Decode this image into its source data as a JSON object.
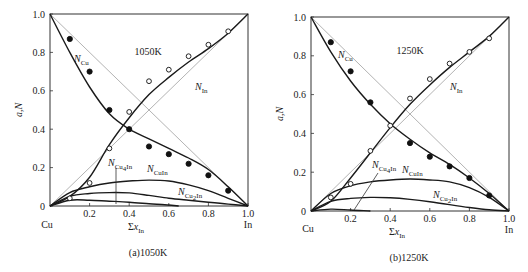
{
  "chart_data": [
    {
      "type": "line",
      "title": "1050K",
      "caption": "(a)1050K",
      "xlabel": "Σx_In",
      "ylabel": "a,N",
      "xlim": [
        0,
        1.0
      ],
      "ylim": [
        0,
        1.0
      ],
      "x_ticks": [
        "0.2",
        "0.4",
        "0.6",
        "0.8",
        "1.0"
      ],
      "y_ticks": [
        "0",
        "0.2",
        "0.4",
        "0.6",
        "0.8",
        "1.0"
      ],
      "x_end_labels": {
        "left": "Cu",
        "right": "In"
      },
      "grid": false,
      "series": [
        {
          "name": "N_Cu (measured a_Cu)",
          "marker": "filled-circle",
          "x": [
            0.1,
            0.2,
            0.3,
            0.4,
            0.5,
            0.6,
            0.7,
            0.8,
            0.9
          ],
          "y": [
            0.87,
            0.7,
            0.5,
            0.4,
            0.31,
            0.27,
            0.22,
            0.16,
            0.08
          ]
        },
        {
          "name": "N_In (measured a_In)",
          "marker": "open-circle",
          "x": [
            0.1,
            0.2,
            0.3,
            0.4,
            0.5,
            0.6,
            0.7,
            0.8,
            0.9
          ],
          "y": [
            0.04,
            0.12,
            0.3,
            0.49,
            0.65,
            0.71,
            0.78,
            0.84,
            0.91
          ]
        },
        {
          "name": "N_Cu curve",
          "x": [
            0,
            0.1,
            0.2,
            0.3,
            0.4,
            0.5,
            0.6,
            0.7,
            0.8,
            0.9,
            1.0
          ],
          "y": [
            1.0,
            0.8,
            0.62,
            0.48,
            0.4,
            0.35,
            0.3,
            0.25,
            0.19,
            0.1,
            0
          ]
        },
        {
          "name": "N_In curve",
          "x": [
            0,
            0.1,
            0.2,
            0.3,
            0.4,
            0.5,
            0.6,
            0.7,
            0.8,
            0.9,
            1.0
          ],
          "y": [
            0,
            0.05,
            0.15,
            0.32,
            0.46,
            0.58,
            0.67,
            0.75,
            0.82,
            0.9,
            1.0
          ]
        },
        {
          "name": "N_CuIn",
          "x": [
            0,
            0.1,
            0.2,
            0.3,
            0.4,
            0.5,
            0.6,
            0.7,
            0.8,
            0.9,
            1.0
          ],
          "y": [
            0,
            0.07,
            0.1,
            0.12,
            0.13,
            0.135,
            0.13,
            0.11,
            0.08,
            0.04,
            0
          ]
        },
        {
          "name": "N_Cu2In",
          "x": [
            0,
            0.1,
            0.2,
            0.3,
            0.4,
            0.5,
            0.6,
            0.7,
            0.8,
            0.9,
            1.0
          ],
          "y": [
            0,
            0.05,
            0.065,
            0.07,
            0.068,
            0.055,
            0.04,
            0.03,
            0.02,
            0.01,
            0
          ]
        },
        {
          "name": "N_Cu4In",
          "x": [
            0,
            0.1,
            0.2,
            0.3,
            0.4,
            0.5,
            0.6,
            0.65
          ],
          "y": [
            0,
            0.03,
            0.03,
            0.025,
            0.02,
            0.012,
            0.005,
            0
          ]
        }
      ],
      "reference_lines": [
        {
          "name": "ideal a_Cu",
          "from": [
            0,
            1
          ],
          "to": [
            1,
            0
          ]
        },
        {
          "name": "ideal a_In",
          "from": [
            0,
            0
          ],
          "to": [
            1,
            1
          ]
        }
      ],
      "annotations": [
        "1050K",
        "N_Cu",
        "N_In",
        "N_Cu4In",
        "N_CuIn",
        "N_Cu2In"
      ]
    },
    {
      "type": "line",
      "title": "1250K",
      "caption": "(b)1250K",
      "xlabel": "Σx_In",
      "ylabel": "a,N",
      "xlim": [
        0,
        1.0
      ],
      "ylim": [
        0,
        1.0
      ],
      "x_ticks": [
        "0.2",
        "0.4",
        "0.6",
        "0.8",
        "1.0"
      ],
      "y_ticks": [
        "0",
        "0.2",
        "0.4",
        "0.6",
        "0.8",
        "1.0"
      ],
      "x_end_labels": {
        "left": "Cu",
        "right": "In"
      },
      "grid": false,
      "series": [
        {
          "name": "N_Cu (measured a_Cu)",
          "marker": "filled-circle",
          "x": [
            0.1,
            0.2,
            0.3,
            0.5,
            0.6,
            0.7,
            0.8,
            0.9
          ],
          "y": [
            0.87,
            0.72,
            0.56,
            0.35,
            0.28,
            0.23,
            0.17,
            0.08
          ]
        },
        {
          "name": "N_In (measured a_In)",
          "marker": "open-circle",
          "x": [
            0.1,
            0.2,
            0.3,
            0.4,
            0.5,
            0.6,
            0.7,
            0.8,
            0.9
          ],
          "y": [
            0.07,
            0.14,
            0.31,
            0.44,
            0.58,
            0.68,
            0.76,
            0.82,
            0.89
          ]
        },
        {
          "name": "N_Cu curve",
          "x": [
            0,
            0.1,
            0.2,
            0.3,
            0.4,
            0.5,
            0.6,
            0.7,
            0.8,
            0.9,
            1.0
          ],
          "y": [
            1.0,
            0.82,
            0.67,
            0.55,
            0.45,
            0.37,
            0.3,
            0.24,
            0.17,
            0.09,
            0
          ]
        },
        {
          "name": "N_In curve",
          "x": [
            0,
            0.1,
            0.2,
            0.3,
            0.4,
            0.5,
            0.6,
            0.7,
            0.8,
            0.9,
            1.0
          ],
          "y": [
            0,
            0.05,
            0.17,
            0.3,
            0.43,
            0.55,
            0.65,
            0.74,
            0.82,
            0.9,
            1.0
          ]
        },
        {
          "name": "N_CuIn",
          "x": [
            0,
            0.1,
            0.2,
            0.3,
            0.4,
            0.5,
            0.6,
            0.7,
            0.8,
            0.9,
            1.0
          ],
          "y": [
            0,
            0.09,
            0.13,
            0.15,
            0.16,
            0.165,
            0.16,
            0.15,
            0.12,
            0.07,
            0
          ]
        },
        {
          "name": "N_Cu2In",
          "x": [
            0,
            0.1,
            0.2,
            0.3,
            0.4,
            0.5,
            0.6,
            0.7,
            0.8,
            0.9,
            1.0
          ],
          "y": [
            0,
            0.05,
            0.065,
            0.07,
            0.068,
            0.06,
            0.048,
            0.033,
            0.018,
            0.006,
            0
          ]
        },
        {
          "name": "N_Cu4In",
          "x": [
            0,
            0.1,
            0.2,
            0.3
          ],
          "y": [
            0,
            0.01,
            0.005,
            0
          ]
        }
      ],
      "reference_lines": [
        {
          "name": "ideal a_Cu",
          "from": [
            0,
            1
          ],
          "to": [
            1,
            0
          ]
        },
        {
          "name": "ideal a_In",
          "from": [
            0,
            0
          ],
          "to": [
            1,
            1
          ]
        }
      ],
      "annotations": [
        "1250K",
        "N_Cu",
        "N_In",
        "N_Cu4In",
        "N_CuIn",
        "N_Cu2In"
      ]
    }
  ],
  "labels": {
    "left": {
      "temp": "1050K",
      "caption": "(a)1050K",
      "ylabel": "a,N",
      "xlabel_sigma": "Σ",
      "xlabel_var": "x",
      "xlabel_sub": "In",
      "cu": "Cu",
      "in": "In"
    },
    "right": {
      "temp": "1250K",
      "caption": "(b)1250K",
      "ylabel": "a,N",
      "xlabel_sigma": "Σ",
      "xlabel_var": "x",
      "xlabel_sub": "In",
      "cu": "Cu",
      "in": "In"
    },
    "n": "N",
    "sub_cu": "Cu",
    "sub_in": "In",
    "sub_cuin": "CuIn",
    "sub_cu2": "Cu",
    "sub_2": "2",
    "sub_4": "4",
    "sub_in_tail": "In",
    "yticks": [
      "0",
      "0.2",
      "0.4",
      "0.6",
      "0.8",
      "1.0"
    ],
    "xticks": [
      "0.2",
      "0.4",
      "0.6",
      "0.8",
      "1.0"
    ]
  }
}
